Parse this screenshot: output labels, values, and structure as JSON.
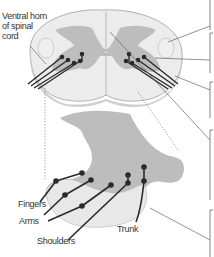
{
  "diagram": {
    "labels": {
      "ventral_horn": [
        "Ventral horn",
        "of spinal",
        "cord"
      ],
      "fingers": "Fingers",
      "arms": "Arms",
      "shoulders": "Shoulders",
      "trunk": "Trunk"
    },
    "colors": {
      "white_matter": "#ececec",
      "gray_matter": "#bdbdbd",
      "outline": "#9a9a9a",
      "neuron": "#2a2a2a",
      "bracket": "#777777"
    }
  }
}
